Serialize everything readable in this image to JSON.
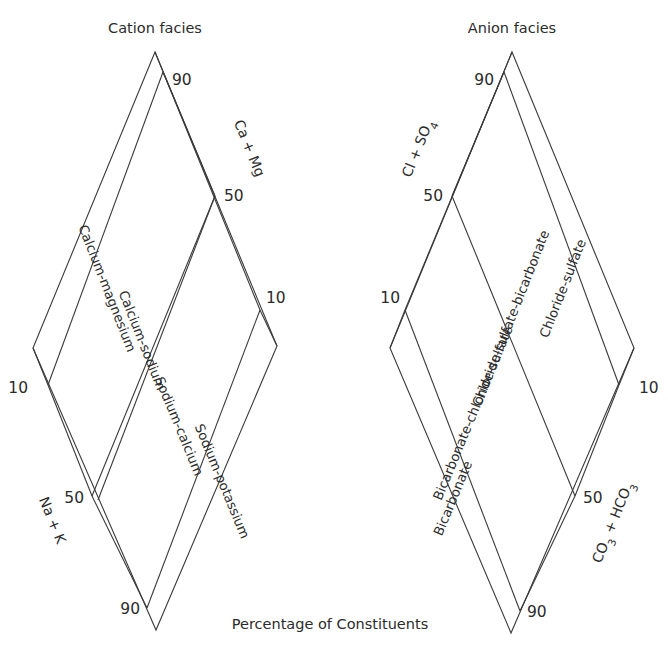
{
  "figure": {
    "caption": "Percentage of Constituents",
    "line_color": "#3a3a3a",
    "text_color": "#2b2b2b",
    "background": "#ffffff"
  },
  "cation": {
    "title": "Cation facies",
    "axis_top_right": "Ca + Mg",
    "axis_bottom_left": "Na + K",
    "ticks": {
      "top": "90",
      "upper_right": "50",
      "right": "10",
      "left": "10",
      "lower_left": "50",
      "bottom": "90"
    },
    "bands": [
      "Calcium-magnesium",
      "Calcium-sodium",
      "Sodium-calcium",
      "Sodium-potassium"
    ]
  },
  "anion": {
    "title": "Anion facies",
    "axis_top_left": "Cl + SO4",
    "axis_bottom_right": "CO3 + HCO3",
    "ticks": {
      "top": "90",
      "upper_left": "50",
      "left": "10",
      "right": "10",
      "lower_right": "50",
      "bottom": "90"
    },
    "bands": [
      "Chloride-sulfate",
      "Chloride-sulfate-bicarbonate",
      "Bicarbonate-chloride-sulfate",
      "Bicarbonate"
    ]
  },
  "chart_data": {
    "type": "diagram",
    "subtype": "piper-diamond-facies",
    "title": "Percentage of Constituents",
    "panels": [
      {
        "name": "Cation facies",
        "axes": [
          "Ca + Mg",
          "Na + K"
        ],
        "tick_values": [
          90,
          50,
          10,
          10,
          50,
          90
        ],
        "facies_bands": [
          {
            "label": "Calcium-magnesium",
            "range": "90-50 Ca+Mg"
          },
          {
            "label": "Calcium-sodium",
            "range": "50-10 Ca+Mg"
          },
          {
            "label": "Sodium-calcium",
            "range": "50-10 Na+K"
          },
          {
            "label": "Sodium-potassium",
            "range": "90-50 Na+K"
          }
        ]
      },
      {
        "name": "Anion facies",
        "axes": [
          "Cl + SO4",
          "CO3 + HCO3"
        ],
        "tick_values": [
          90,
          50,
          10,
          10,
          50,
          90
        ],
        "facies_bands": [
          {
            "label": "Chloride-sulfate",
            "range": "90-50 Cl+SO4"
          },
          {
            "label": "Chloride-sulfate-bicarbonate",
            "range": "50-10 Cl+SO4"
          },
          {
            "label": "Bicarbonate-chloride-sulfate",
            "range": "50-10 CO3+HCO3"
          },
          {
            "label": "Bicarbonate",
            "range": "90-50 CO3+HCO3"
          }
        ]
      }
    ]
  }
}
